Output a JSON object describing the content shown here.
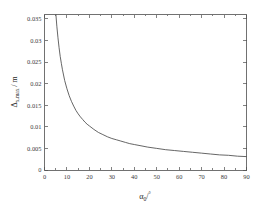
{
  "figure": {
    "background_color": "#ffffff",
    "axes_color": "#4d4d4d",
    "curve_color": "#555555",
    "tick_label_color": "#3a3a3a"
  },
  "chart_data": {
    "type": "line",
    "title": "",
    "subtitle": "",
    "xlabel": "α₀/°",
    "xlabel_parts": {
      "symbol": "α",
      "subscript": "0",
      "unit": "/°"
    },
    "ylabel": "Δx,max / m",
    "ylabel_parts": {
      "symbol": "Δ",
      "subscript": "x,max",
      "unit": "/m"
    },
    "xlim": [
      0,
      90
    ],
    "ylim": [
      0,
      0.036
    ],
    "grid": false,
    "legend": null,
    "legend_position": "none",
    "box": true,
    "tick_direction": "in",
    "xticks": [
      0,
      10,
      20,
      30,
      40,
      50,
      60,
      70,
      80,
      90
    ],
    "xticklabels": [
      "0",
      "10",
      "20",
      "30",
      "40",
      "50",
      "60",
      "70",
      "80",
      "90"
    ],
    "yticks": [
      0,
      0.005,
      0.01,
      0.015,
      0.02,
      0.025,
      0.03,
      0.035
    ],
    "yticklabels": [
      "0",
      "0.005",
      "0.01",
      "0.015",
      "0.02",
      "0.025",
      "0.03",
      "0.035"
    ],
    "series": [
      {
        "name": "delta-x-max",
        "color": "#555555",
        "x": [
          4.5,
          5,
          5.5,
          6,
          6.5,
          7,
          7.5,
          8,
          9,
          10,
          11,
          12,
          13,
          14,
          15,
          16,
          17,
          18,
          19,
          20,
          22,
          24,
          26,
          28,
          30,
          32,
          34,
          36,
          38,
          40,
          43,
          46,
          50,
          54,
          58,
          62,
          66,
          70,
          74,
          78,
          82,
          86,
          90
        ],
        "y": [
          0.0405,
          0.0365,
          0.0333,
          0.0306,
          0.0283,
          0.0263,
          0.0247,
          0.0232,
          0.0207,
          0.0188,
          0.0172,
          0.0159,
          0.0148,
          0.0138,
          0.013,
          0.0123,
          0.0117,
          0.0111,
          0.0106,
          0.0102,
          0.0094,
          0.0087,
          0.0082,
          0.0077,
          0.0073,
          0.007,
          0.0067,
          0.0064,
          0.0061,
          0.0059,
          0.0056,
          0.0053,
          0.005,
          0.0047,
          0.0045,
          0.0043,
          0.0041,
          0.0039,
          0.0037,
          0.0035,
          0.0034,
          0.0032,
          0.0031
        ]
      }
    ],
    "annotations": []
  }
}
